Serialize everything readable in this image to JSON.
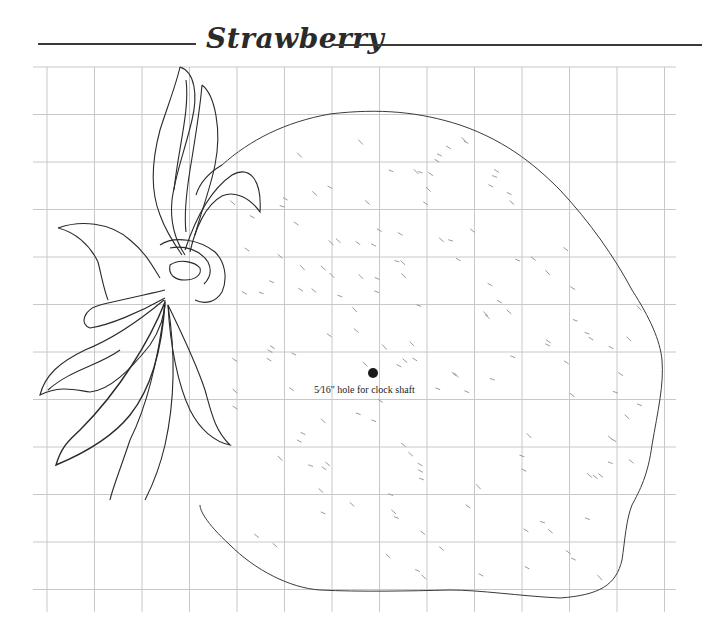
{
  "header": {
    "title": "Strawberry"
  },
  "pattern": {
    "subject": "Strawberry clock face pattern",
    "grid": {
      "columns": 13,
      "rows": 11,
      "line_color": "#c8c8c8"
    },
    "outline_color": "#2a2a2a",
    "hole": {
      "size_fraction": "5⁄16\"",
      "label": "hole for clock shaft"
    }
  }
}
